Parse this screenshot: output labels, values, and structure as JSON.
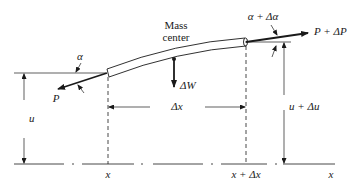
{
  "labels": {
    "mass_center_line1": "Mass",
    "mass_center_line2": "center",
    "alpha": "α",
    "alpha_plus": "α + Δα",
    "force_left": "P",
    "force_right": "P + ΔP",
    "weight": "ΔW",
    "dx": "Δx",
    "u": "u",
    "u_plus": "u + Δu",
    "x_left": "x",
    "x_right": "x + Δx",
    "x_axis": "x"
  },
  "colors": {
    "ink": "#1a1a1a",
    "background": "#ffffff"
  }
}
